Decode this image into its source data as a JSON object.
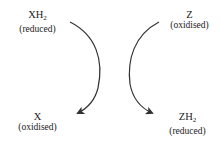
{
  "diagram": {
    "type": "coupled redox reaction",
    "left": {
      "start": {
        "symbol": "XH",
        "subscript": "2",
        "state": "(reduced)"
      },
      "end": {
        "symbol": "X",
        "subscript": "",
        "state": "(oxidised)"
      }
    },
    "right": {
      "start": {
        "symbol": "Z",
        "subscript": "",
        "state": "(oxidised)"
      },
      "end": {
        "symbol": "ZH",
        "subscript": "2",
        "state": "(reduced)"
      }
    },
    "colors": {
      "arrow": "#333333",
      "text": "#222222",
      "background": "#ffffff"
    }
  }
}
